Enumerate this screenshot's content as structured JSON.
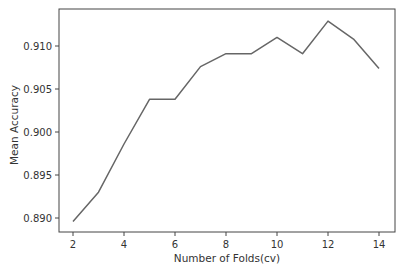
{
  "chart_data": {
    "type": "line",
    "title": "",
    "xlabel": "Number of Folds(cv)",
    "ylabel": "Mean Accuracy",
    "x": [
      2,
      3,
      4,
      5,
      6,
      7,
      8,
      9,
      10,
      11,
      12,
      13,
      14
    ],
    "series": [
      {
        "name": "Mean Accuracy",
        "color": "#666666",
        "values": [
          0.8896,
          0.893,
          0.8986,
          0.9038,
          0.9038,
          0.9076,
          0.9091,
          0.9091,
          0.911,
          0.9091,
          0.9129,
          0.9108,
          0.9074
        ]
      }
    ],
    "xticks": [
      2,
      4,
      6,
      8,
      10,
      12,
      14
    ],
    "xtick_labels": [
      "2",
      "4",
      "6",
      "8",
      "10",
      "12",
      "14"
    ],
    "yticks": [
      0.89,
      0.895,
      0.9,
      0.905,
      0.91
    ],
    "ytick_labels": [
      "0.890",
      "0.895",
      "0.900",
      "0.905",
      "0.910"
    ],
    "xlim": [
      1.4,
      14.6
    ],
    "ylim": [
      0.8886,
      0.914
    ],
    "grid": false,
    "legend": "none"
  }
}
